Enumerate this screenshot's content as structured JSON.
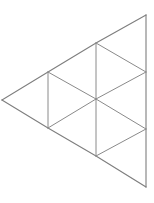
{
  "figure": {
    "background_color": "#ffffff",
    "line_color": "#8a8a8a",
    "outline_color": "#7e7e7e",
    "line_width": 1,
    "canvas": {
      "width": 154,
      "height": 203
    },
    "vertices": [
      {
        "id": "v-left",
        "label": "A",
        "x": 2,
        "y": 100
      },
      {
        "id": "v-upper-left",
        "label": "B",
        "x": 48,
        "y": 72
      },
      {
        "id": "v-lower-left",
        "label": "C",
        "x": 48,
        "y": 128
      },
      {
        "id": "v-upper-mid",
        "label": "D",
        "x": 96,
        "y": 43
      },
      {
        "id": "v-center",
        "label": "E",
        "x": 96,
        "y": 99
      },
      {
        "id": "v-lower-mid",
        "label": "F",
        "x": 96,
        "y": 156
      },
      {
        "id": "v-top",
        "label": "G",
        "x": 146,
        "y": 15
      },
      {
        "id": "v-right-upper",
        "label": "H",
        "x": 146,
        "y": 72
      },
      {
        "id": "v-right-lower",
        "label": "I",
        "x": 146,
        "y": 129
      },
      {
        "id": "v-bottom",
        "label": "J",
        "x": 146,
        "y": 187
      }
    ],
    "edges": [
      {
        "id": "e-outline-upper-left",
        "from": "v-left",
        "to": "v-top",
        "kind": "outline",
        "points": "2,100 48,72 96,43 146,15"
      },
      {
        "id": "e-outline-right",
        "from": "v-top",
        "to": "v-bottom",
        "kind": "outline",
        "points": "146,15 146,72 146,129 146,187"
      },
      {
        "id": "e-outline-lower-left",
        "from": "v-bottom",
        "to": "v-left",
        "kind": "outline",
        "points": "146,187 96,156 48,128 2,100"
      },
      {
        "id": "e-vert-left",
        "from": "v-upper-left",
        "to": "v-lower-left",
        "kind": "inner",
        "points": "48,72 48,128"
      },
      {
        "id": "e-vert-mid-upper",
        "from": "v-upper-mid",
        "to": "v-center",
        "kind": "inner",
        "points": "96,43 96,99"
      },
      {
        "id": "e-vert-mid-lower",
        "from": "v-center",
        "to": "v-lower-mid",
        "kind": "inner",
        "points": "96,99 96,156"
      },
      {
        "id": "e-diag-b-e",
        "from": "v-upper-left",
        "to": "v-center",
        "kind": "inner",
        "points": "48,72 96,99"
      },
      {
        "id": "e-diag-e-h",
        "from": "v-center",
        "to": "v-right-upper",
        "kind": "inner",
        "points": "96,99 146,72"
      },
      {
        "id": "e-diag-d-h",
        "from": "v-upper-mid",
        "to": "v-right-upper",
        "kind": "inner",
        "points": "96,43 146,72"
      },
      {
        "id": "e-diag-c-e",
        "from": "v-lower-left",
        "to": "v-center",
        "kind": "inner",
        "points": "48,128 96,99"
      },
      {
        "id": "e-diag-e-i",
        "from": "v-center",
        "to": "v-right-lower",
        "kind": "inner",
        "points": "96,99 146,129"
      },
      {
        "id": "e-diag-f-i",
        "from": "v-lower-mid",
        "to": "v-right-lower",
        "kind": "inner",
        "points": "96,156 146,129"
      }
    ],
    "triangles": [
      {
        "id": "t-left",
        "vertices": "v-left,v-upper-left,v-lower-left",
        "orientation": "left-pointing"
      },
      {
        "id": "t-upper-1",
        "vertices": "v-upper-left,v-upper-mid,v-center",
        "orientation": "right-pointing"
      },
      {
        "id": "t-upper-2",
        "vertices": "v-upper-mid,v-center,v-right-upper",
        "orientation": "left-pointing"
      },
      {
        "id": "t-upper-3",
        "vertices": "v-upper-mid,v-top,v-right-upper",
        "orientation": "right-pointing"
      },
      {
        "id": "t-lower-1",
        "vertices": "v-lower-left,v-center,v-lower-mid",
        "orientation": "right-pointing"
      },
      {
        "id": "t-lower-2",
        "vertices": "v-center,v-lower-mid,v-right-lower",
        "orientation": "left-pointing"
      },
      {
        "id": "t-lower-3",
        "vertices": "v-lower-mid,v-right-lower,v-bottom",
        "orientation": "right-pointing"
      }
    ]
  }
}
